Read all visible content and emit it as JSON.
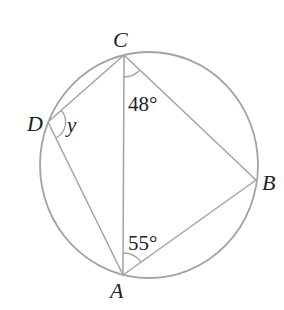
{
  "diagram": {
    "type": "cyclic-quadrilateral",
    "colors": {
      "background": "#ffffff",
      "stroke": "#a3a3a3",
      "text": "#222222"
    },
    "circle": {
      "cx": 149,
      "cy": 165,
      "rx": 109,
      "ry": 113
    },
    "vertices": {
      "A": {
        "label": "A",
        "x": 123,
        "y": 275,
        "label_x": 110,
        "label_y": 298
      },
      "B": {
        "label": "B",
        "x": 256,
        "y": 180,
        "label_x": 262,
        "label_y": 190
      },
      "C": {
        "label": "C",
        "x": 124,
        "y": 55,
        "label_x": 113,
        "label_y": 47
      },
      "D": {
        "label": "D",
        "x": 48,
        "y": 122,
        "label_x": 27,
        "label_y": 131
      }
    },
    "segments": [
      "CD",
      "DA",
      "CA",
      "CB",
      "AB"
    ],
    "angles": [
      {
        "at": "C",
        "between": "AC-CB",
        "text": "48°",
        "text_x": 128,
        "text_y": 111
      },
      {
        "at": "A",
        "between": "CA-AB",
        "text": "55°",
        "text_x": 128,
        "text_y": 250
      },
      {
        "at": "D",
        "between": "CD-DA",
        "text": "y",
        "text_x": 67,
        "text_y": 132
      }
    ]
  }
}
